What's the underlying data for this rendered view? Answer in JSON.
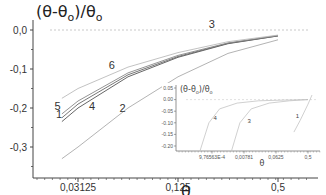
{
  "chart_data": [
    {
      "type": "line",
      "title": "",
      "ylabel": "(θ-θ0)/θ0",
      "xlabel": "θ",
      "xscale": "log2",
      "xlim": [
        0.02,
        0.6
      ],
      "ylim": [
        -0.34,
        0.03
      ],
      "xticks": [
        0.03125,
        0.125,
        0.5
      ],
      "xtick_labels": [
        "0,03125",
        "0,125",
        "0,5"
      ],
      "yticks": [
        0.0,
        -0.1,
        -0.2,
        -0.3
      ],
      "ytick_labels": [
        "0,0",
        "-0,1",
        "-0,2",
        "-0,3"
      ],
      "reference_line": {
        "y": 0.0,
        "style": "dashed",
        "label": "3"
      },
      "grid": false,
      "series": [
        {
          "name": "1",
          "x": [
            0.025,
            0.03125,
            0.0625,
            0.125,
            0.25,
            0.5
          ],
          "y": [
            -0.235,
            -0.2,
            -0.12,
            -0.07,
            -0.035,
            -0.015
          ]
        },
        {
          "name": "2",
          "x": [
            0.025,
            0.03125,
            0.0625,
            0.125,
            0.25,
            0.5
          ],
          "y": [
            -0.33,
            -0.3,
            -0.2,
            -0.12,
            -0.06,
            -0.025
          ]
        },
        {
          "name": "4",
          "x": [
            0.025,
            0.03125,
            0.0625,
            0.125,
            0.25,
            0.5
          ],
          "y": [
            -0.225,
            -0.19,
            -0.115,
            -0.068,
            -0.034,
            -0.015
          ]
        },
        {
          "name": "5",
          "x": [
            0.025,
            0.03125,
            0.0625,
            0.125,
            0.25,
            0.5
          ],
          "y": [
            -0.215,
            -0.182,
            -0.11,
            -0.065,
            -0.033,
            -0.014
          ]
        },
        {
          "name": "6",
          "x": [
            0.025,
            0.03125,
            0.0625,
            0.125,
            0.25,
            0.5
          ],
          "y": [
            -0.175,
            -0.15,
            -0.095,
            -0.058,
            -0.03,
            -0.013
          ]
        }
      ],
      "curve_labels": [
        {
          "text": "1",
          "x": 0.024,
          "y": -0.225
        },
        {
          "text": "2",
          "x": 0.058,
          "y": -0.21
        },
        {
          "text": "3",
          "x": 0.2,
          "y": 0.005
        },
        {
          "text": "4",
          "x": 0.038,
          "y": -0.205
        },
        {
          "text": "5",
          "x": 0.0235,
          "y": -0.205
        },
        {
          "text": "6",
          "x": 0.05,
          "y": -0.1
        }
      ]
    },
    {
      "type": "line",
      "title": "inset",
      "ylabel": "(θ-θ0)/θ0",
      "xlabel": "θ",
      "xscale": "log",
      "xlim": [
        0.0003,
        0.7
      ],
      "ylim": [
        -0.23,
        0.06
      ],
      "xticks": [
        0.000976563,
        0.00781,
        0.0625,
        0.5
      ],
      "xtick_labels": [
        "9,76563E-4",
        "0,00781",
        "0,0625",
        "0,5"
      ],
      "yticks": [
        0.05,
        0.0,
        -0.05,
        -0.1,
        -0.15,
        -0.2
      ],
      "ytick_labels": [
        "0.05",
        "0.00",
        "-0.05",
        "-0.10",
        "-0.15",
        "-0.20"
      ],
      "reference_line": {
        "y": 0.0,
        "style": "dashed"
      },
      "series": [
        {
          "name": "1",
          "x": [
            0.2,
            0.3,
            0.5,
            0.65
          ],
          "y": [
            -0.14,
            -0.09,
            -0.02,
            0.02
          ]
        },
        {
          "name": "3",
          "x": [
            0.0035,
            0.006,
            0.0125,
            0.04,
            0.15,
            0.5
          ],
          "y": [
            -0.22,
            -0.1,
            -0.04,
            -0.015,
            -0.005,
            0.0
          ]
        },
        {
          "name": "4",
          "x": [
            0.00045,
            0.0008,
            0.0016,
            0.005,
            0.02,
            0.1,
            0.5
          ],
          "y": [
            -0.22,
            -0.1,
            -0.04,
            -0.015,
            -0.005,
            -0.002,
            0.0
          ]
        }
      ],
      "curve_labels": [
        {
          "text": "4",
          "x": 0.0012,
          "y": -0.09
        },
        {
          "text": "3",
          "x": 0.011,
          "y": -0.1
        },
        {
          "text": "1",
          "x": 0.25,
          "y": -0.08
        }
      ]
    }
  ],
  "labels": {
    "ylabel_main": "(θ-θ",
    "ylabel_sub": "o",
    "ylabel_mid": ")/θ",
    "xlabel": "θ",
    "inset_ylabel_main": "(θ-θ",
    "inset_ylabel_mid": ")/θ"
  }
}
